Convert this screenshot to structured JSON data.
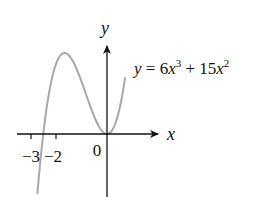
{
  "chart_data": {
    "type": "line",
    "title": "",
    "equation": "y = 6x^3 + 15x^2",
    "equation_parts": {
      "lhs": "y",
      "eq": " = 6",
      "x1": "x",
      "p1": "3",
      "mid": " + 15",
      "x2": "x",
      "p2": "2"
    },
    "xlabel": "x",
    "ylabel": "y",
    "x_tick_labels": [
      "−3",
      "−2",
      "0"
    ],
    "x_ticks": [
      -3,
      -2,
      0
    ],
    "function": {
      "a3": 6,
      "a2": 15,
      "a1": 0,
      "a0": 0
    },
    "roots": [
      -2.5,
      0
    ],
    "local_max": {
      "x": -1.667,
      "y": 13.9
    },
    "local_min": {
      "x": 0,
      "y": 0
    },
    "xlim": [
      -3.5,
      2
    ],
    "grid": false,
    "curve_color": "#a8a8a8",
    "axis_color": "#111111"
  }
}
